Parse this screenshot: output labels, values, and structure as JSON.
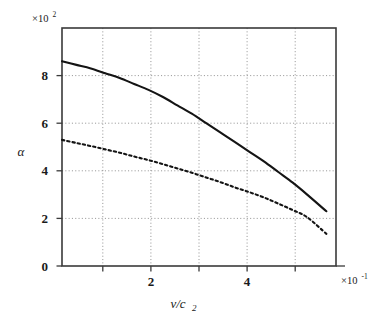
{
  "figure": {
    "background_color": "#ffffff",
    "axis_color": "#3a3a3a",
    "grid_color": "#8f8f8f",
    "curve_color": "#141414"
  },
  "axes": {
    "y_multiplier_base": "×10",
    "y_multiplier_exponent": "2",
    "x_multiplier_base": "×10",
    "x_multiplier_exponent": "-1",
    "y_label": "α",
    "x_label_base": "v/c",
    "x_label_sub": "2",
    "y_ticks": [
      "0",
      "2",
      "4",
      "6",
      "8"
    ],
    "y_tick_values": [
      0,
      2,
      4,
      6,
      8
    ],
    "x_ticks": [
      "2",
      "4"
    ],
    "x_tick_values": [
      2,
      4
    ],
    "x_gridlines": [
      1,
      2,
      3,
      4,
      5
    ],
    "y_gridlines": [
      2,
      4,
      6,
      8
    ]
  },
  "chart_data": {
    "type": "line",
    "title": "",
    "subtitle": "",
    "xlabel": "v/c₂",
    "ylabel": "α",
    "xlabel_multiplier": "×10⁻¹",
    "ylabel_multiplier": "×10²",
    "xlim": [
      0,
      5.7
    ],
    "ylim": [
      0,
      10
    ],
    "x_tick_labels": [
      "2",
      "4"
    ],
    "y_tick_labels": [
      "0",
      "2",
      "4",
      "6",
      "8"
    ],
    "grid": true,
    "grid_style": "dotted",
    "legend": "none",
    "legend_position": "none",
    "annotations": [],
    "series": [
      {
        "name": "solid-curve",
        "style": "solid",
        "color": "#141414",
        "x": [
          0.0,
          0.3,
          0.6,
          0.9,
          1.2,
          1.5,
          1.8,
          2.1,
          2.4,
          2.7,
          3.0,
          3.3,
          3.6,
          3.9,
          4.2,
          4.5,
          4.8,
          5.1,
          5.5
        ],
        "y": [
          8.6,
          8.45,
          8.3,
          8.1,
          7.9,
          7.65,
          7.4,
          7.1,
          6.75,
          6.4,
          6.0,
          5.6,
          5.2,
          4.8,
          4.4,
          3.95,
          3.5,
          3.0,
          2.3
        ]
      },
      {
        "name": "dashed-curve",
        "style": "dashed",
        "color": "#141414",
        "x": [
          0.0,
          0.3,
          0.6,
          0.9,
          1.2,
          1.5,
          1.8,
          2.1,
          2.4,
          2.7,
          3.0,
          3.3,
          3.6,
          3.9,
          4.2,
          4.5,
          4.8,
          5.1,
          5.5
        ],
        "y": [
          5.3,
          5.17,
          5.04,
          4.9,
          4.76,
          4.6,
          4.45,
          4.28,
          4.1,
          3.92,
          3.72,
          3.52,
          3.3,
          3.1,
          2.88,
          2.62,
          2.35,
          2.05,
          1.35
        ]
      }
    ]
  }
}
